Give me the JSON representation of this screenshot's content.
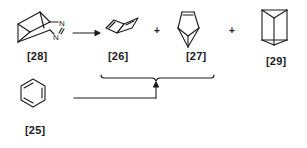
{
  "diagram": {
    "type": "reaction-scheme",
    "line_color": "#1a1a1a",
    "reactant": {
      "label": "[28]",
      "atoms": [
        "N",
        "N"
      ]
    },
    "reaction_arrow": "→",
    "products": [
      {
        "label": "[26]"
      },
      {
        "label": "[27]"
      },
      {
        "label": "[29]"
      }
    ],
    "plus_signs": [
      "+",
      "+"
    ],
    "side_source": {
      "label": "[25]",
      "name": "benzene"
    }
  }
}
